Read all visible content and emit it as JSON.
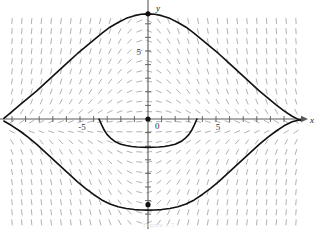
{
  "figure": {
    "width": 318,
    "height": 229,
    "background": "#ffffff",
    "caption": "Figure 1.7"
  },
  "axes": {
    "x_label": "x",
    "y_label": "y",
    "origin_label": "0",
    "axis_color": "#5a5a5a",
    "origin_px": {
      "x": 148,
      "y": 119
    },
    "unit_px": 13.6,
    "xlim": [
      -10.6,
      11.5
    ],
    "ylim": [
      -8.2,
      8.9
    ],
    "x_ticks": [
      -10,
      -9,
      -8,
      -7,
      -6,
      -5,
      -4,
      -3,
      -2,
      -1,
      1,
      2,
      3,
      4,
      5,
      6,
      7,
      8,
      9,
      10
    ],
    "y_ticks": [
      -7,
      -6,
      -5,
      -4,
      -3,
      -2,
      -1,
      1,
      2,
      3,
      4,
      5,
      6,
      7
    ],
    "x_tick_labels": [
      {
        "value": -5,
        "text": "-5"
      },
      {
        "value": 5,
        "text": "5"
      }
    ],
    "y_tick_labels": [
      {
        "value": 5,
        "text": "5"
      }
    ],
    "grid": false
  },
  "chart_data": {
    "type": "line",
    "title": "",
    "xlabel": "x",
    "ylabel": "y",
    "xlim": [
      -10.6,
      11.5
    ],
    "ylim": [
      -8.2,
      8.9
    ],
    "grid": false,
    "field": {
      "name": "slope-field",
      "color": "#a8a8a8",
      "description": "direction field of dy/dx",
      "x_start": -10.0,
      "x_step": 0.72,
      "x_count": 30,
      "y_start": -7.6,
      "y_step": 0.74,
      "y_count": 21,
      "dash_length_px": 6
    },
    "series": [
      {
        "name": "upper-solution-curve",
        "color": "#111111",
        "width": 1.6,
        "points": [
          [
            -10.6,
            0.05
          ],
          [
            -10.0,
            0.55
          ],
          [
            -9.4,
            1.05
          ],
          [
            -8.8,
            1.55
          ],
          [
            -8.2,
            2.05
          ],
          [
            -7.6,
            2.6
          ],
          [
            -7.0,
            3.15
          ],
          [
            -6.4,
            3.7
          ],
          [
            -5.8,
            4.25
          ],
          [
            -5.2,
            4.8
          ],
          [
            -4.6,
            5.3
          ],
          [
            -4.0,
            5.8
          ],
          [
            -3.4,
            6.3
          ],
          [
            -2.8,
            6.75
          ],
          [
            -2.2,
            7.1
          ],
          [
            -1.6,
            7.4
          ],
          [
            -1.0,
            7.6
          ],
          [
            -0.5,
            7.7
          ],
          [
            0.0,
            7.73
          ],
          [
            0.5,
            7.7
          ],
          [
            1.0,
            7.6
          ],
          [
            1.6,
            7.4
          ],
          [
            2.2,
            7.1
          ],
          [
            2.8,
            6.75
          ],
          [
            3.4,
            6.3
          ],
          [
            4.0,
            5.8
          ],
          [
            4.6,
            5.3
          ],
          [
            5.2,
            4.8
          ],
          [
            5.8,
            4.25
          ],
          [
            6.4,
            3.7
          ],
          [
            7.0,
            3.15
          ],
          [
            7.6,
            2.6
          ],
          [
            8.2,
            2.05
          ],
          [
            8.8,
            1.55
          ],
          [
            9.4,
            1.05
          ],
          [
            10.0,
            0.6
          ],
          [
            10.6,
            0.2
          ],
          [
            11.2,
            -0.1
          ]
        ],
        "markers": [
          {
            "x": 0.0,
            "y": 7.73,
            "style": "filled-dot"
          }
        ]
      },
      {
        "name": "lower-solution-curve",
        "color": "#111111",
        "width": 1.6,
        "points": [
          [
            -10.6,
            -0.15
          ],
          [
            -10.0,
            -0.5
          ],
          [
            -9.4,
            -0.9
          ],
          [
            -8.8,
            -1.35
          ],
          [
            -8.2,
            -1.85
          ],
          [
            -7.6,
            -2.4
          ],
          [
            -7.0,
            -2.95
          ],
          [
            -6.4,
            -3.5
          ],
          [
            -5.8,
            -4.05
          ],
          [
            -5.2,
            -4.6
          ],
          [
            -4.6,
            -5.1
          ],
          [
            -4.0,
            -5.55
          ],
          [
            -3.4,
            -5.95
          ],
          [
            -2.8,
            -6.25
          ],
          [
            -2.2,
            -6.45
          ],
          [
            -1.6,
            -6.58
          ],
          [
            -1.0,
            -6.66
          ],
          [
            -0.5,
            -6.69
          ],
          [
            0.0,
            -6.7
          ],
          [
            0.5,
            -6.69
          ],
          [
            1.0,
            -6.66
          ],
          [
            1.6,
            -6.58
          ],
          [
            2.2,
            -6.45
          ],
          [
            2.8,
            -6.25
          ],
          [
            3.4,
            -5.95
          ],
          [
            4.0,
            -5.55
          ],
          [
            4.6,
            -5.1
          ],
          [
            5.2,
            -4.6
          ],
          [
            5.8,
            -4.05
          ],
          [
            6.4,
            -3.5
          ],
          [
            7.0,
            -2.95
          ],
          [
            7.6,
            -2.4
          ],
          [
            8.2,
            -1.85
          ],
          [
            8.8,
            -1.35
          ],
          [
            9.4,
            -0.9
          ],
          [
            10.0,
            -0.5
          ],
          [
            10.6,
            -0.2
          ],
          [
            11.2,
            -0.05
          ]
        ],
        "markers": [
          {
            "x": 0.0,
            "y": -6.3,
            "style": "filled-dot"
          }
        ]
      },
      {
        "name": "inner-solution-arc",
        "color": "#111111",
        "width": 1.6,
        "points": [
          [
            -3.6,
            0.0
          ],
          [
            -3.4,
            -0.45
          ],
          [
            -3.2,
            -0.85
          ],
          [
            -3.0,
            -1.15
          ],
          [
            -2.7,
            -1.45
          ],
          [
            -2.4,
            -1.68
          ],
          [
            -2.0,
            -1.85
          ],
          [
            -1.6,
            -1.95
          ],
          [
            -1.2,
            -2.02
          ],
          [
            -0.8,
            -2.06
          ],
          [
            -0.4,
            -2.08
          ],
          [
            0.0,
            -2.09
          ],
          [
            0.4,
            -2.08
          ],
          [
            0.8,
            -2.06
          ],
          [
            1.2,
            -2.02
          ],
          [
            1.6,
            -1.95
          ],
          [
            2.0,
            -1.85
          ],
          [
            2.4,
            -1.68
          ],
          [
            2.7,
            -1.45
          ],
          [
            3.0,
            -1.15
          ],
          [
            3.2,
            -0.85
          ],
          [
            3.4,
            -0.45
          ],
          [
            3.6,
            0.0
          ]
        ],
        "markers": []
      }
    ],
    "origin_marker": {
      "x": 0,
      "y": 0,
      "style": "filled-dot",
      "label": "0"
    }
  }
}
